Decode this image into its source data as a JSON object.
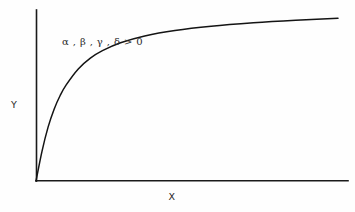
{
  "figure": {
    "background_color": "#fefefe",
    "line_color": "#141414",
    "axis_color": "#1a1a1a"
  },
  "chart_data": {
    "type": "line",
    "title": "",
    "subtitle": "",
    "xlabel": "X",
    "ylabel": "Y",
    "grid": false,
    "legend": null,
    "axis_style": "open L-shaped axes, no tick marks, no tick labels",
    "curve_shape": "monotonically increasing, concave down, saturating toward a horizontal asymptote",
    "annotations": [
      {
        "name": "parameter-condition",
        "text": "α , β , γ , δ > 0",
        "x_px": 62,
        "y_px": 44
      }
    ],
    "xlim": [
      0,
      1
    ],
    "ylim": [
      0,
      1
    ],
    "x": [
      0.0,
      0.02,
      0.04,
      0.06,
      0.08,
      0.1,
      0.14,
      0.18,
      0.22,
      0.28,
      0.36,
      0.46,
      0.58,
      0.72,
      0.86,
      1.0
    ],
    "y": [
      0.0,
      0.175,
      0.315,
      0.42,
      0.5,
      0.562,
      0.655,
      0.718,
      0.762,
      0.808,
      0.848,
      0.88,
      0.905,
      0.925,
      0.94,
      0.952
    ],
    "asymptote_y": 0.96
  },
  "labels": {
    "y_axis": "Y",
    "x_axis": "X"
  },
  "annotation": {
    "condition": "α , β , γ , δ > 0"
  }
}
